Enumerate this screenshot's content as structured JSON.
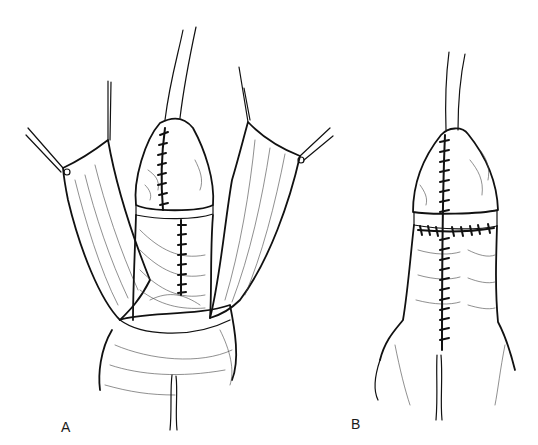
{
  "figure": {
    "panels": [
      {
        "label": "A",
        "content": "Skin flaps retracted with stay sutures; glans and shaft sutured along midline with catheter in place"
      },
      {
        "label": "B",
        "content": "Completed repair with midline and circumferential coronal suture lines; catheter in place"
      }
    ]
  },
  "colors": {
    "background": "#ffffff",
    "ink": "#111111"
  }
}
